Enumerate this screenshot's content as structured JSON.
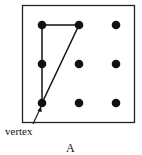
{
  "diagram": {
    "type": "geoboard-triangle",
    "grid": {
      "rows": 3,
      "cols": 3
    },
    "dots": [
      {
        "row": 0,
        "col": 0
      },
      {
        "row": 0,
        "col": 1
      },
      {
        "row": 0,
        "col": 2
      },
      {
        "row": 1,
        "col": 0
      },
      {
        "row": 1,
        "col": 1
      },
      {
        "row": 1,
        "col": 2
      },
      {
        "row": 2,
        "col": 0
      },
      {
        "row": 2,
        "col": 1
      },
      {
        "row": 2,
        "col": 2
      }
    ],
    "triangle_vertices": [
      {
        "row": 0,
        "col": 0
      },
      {
        "row": 0,
        "col": 1
      },
      {
        "row": 2,
        "col": 0
      }
    ],
    "annotation": {
      "text": "vertex",
      "points_to": {
        "row": 2,
        "col": 0
      }
    },
    "caption": "A",
    "colors": {
      "stroke": "#111111",
      "dot": "#111111",
      "background": "#ffffff"
    }
  }
}
